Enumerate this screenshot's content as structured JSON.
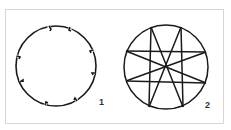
{
  "figure": {
    "panels": [
      {
        "label": "1",
        "description": "circle with eight evenly spaced notches"
      },
      {
        "label": "2",
        "description": "circle inscribed with eight-pointed star of chords"
      }
    ],
    "colors": {
      "stroke": "#1a1a1a",
      "frame": "#d6d6d6",
      "background": "#ffffff"
    }
  }
}
